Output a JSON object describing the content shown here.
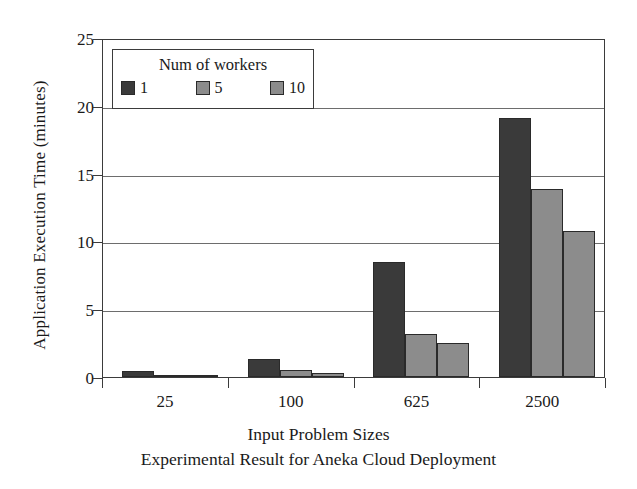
{
  "chart_data": {
    "type": "bar",
    "title": "",
    "caption": "Experimental Result for Aneka Cloud Deployment",
    "xlabel": "Input Problem Sizes",
    "ylabel": "Application Execution Time (minutes)",
    "categories": [
      "25",
      "100",
      "625",
      "2500"
    ],
    "series": [
      {
        "name": "1",
        "color": "#3a3a3a",
        "values": [
          0.45,
          1.3,
          8.45,
          19.1
        ]
      },
      {
        "name": "5",
        "color": "#8c8c8c",
        "values": [
          0.15,
          0.5,
          3.2,
          13.85
        ]
      },
      {
        "name": "10",
        "color": "#8c8c8c",
        "values": [
          0.1,
          0.3,
          2.5,
          10.8
        ]
      }
    ],
    "ylim": [
      0,
      25
    ],
    "yticks": [
      "0",
      "5",
      "10",
      "15",
      "20",
      "25"
    ],
    "ytick_values": [
      0,
      5,
      10,
      15,
      20,
      25
    ],
    "grid": true,
    "legend_position": "upper-left",
    "legend_title": "Num of workers"
  },
  "legend": {
    "title": "Num of workers",
    "entries": [
      {
        "label": "1",
        "color": "#3a3a3a"
      },
      {
        "label": "5",
        "color": "#8c8c8c"
      },
      {
        "label": "10",
        "color": "#8c8c8c"
      }
    ]
  },
  "axes": {
    "y_title": "Application Execution Time (minutes)",
    "x_title": "Input Problem Sizes",
    "caption": "Experimental Result for Aneka Cloud Deployment"
  },
  "colors": {
    "axis": "#3b3b3b",
    "grid": "#6d6d6d",
    "background": "#ffffff",
    "series_dark": "#3a3a3a",
    "series_gray": "#8c8c8c"
  }
}
